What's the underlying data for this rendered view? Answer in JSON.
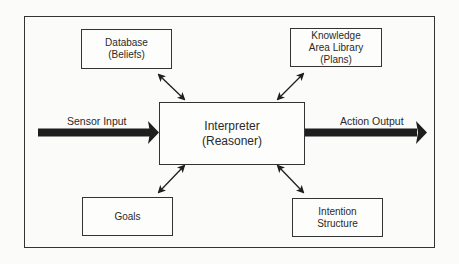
{
  "diagram": {
    "nodes": {
      "database": {
        "lines": [
          "Database",
          "(Beliefs)"
        ]
      },
      "knowledge": {
        "lines": [
          "Knowledge",
          "Area Library",
          "(Plans)"
        ]
      },
      "interpreter": {
        "lines": [
          "Interpreter",
          "(Reasoner)"
        ]
      },
      "goals": {
        "lines": [
          "Goals"
        ]
      },
      "intention": {
        "lines": [
          "Intention",
          "Structure"
        ]
      }
    },
    "edges": {
      "sensor_input": "Sensor Input",
      "action_output": "Action Output"
    },
    "connections": [
      {
        "from": "database",
        "to": "interpreter",
        "type": "bidirectional"
      },
      {
        "from": "knowledge",
        "to": "interpreter",
        "type": "bidirectional"
      },
      {
        "from": "goals",
        "to": "interpreter",
        "type": "bidirectional"
      },
      {
        "from": "intention",
        "to": "interpreter",
        "type": "bidirectional"
      }
    ],
    "colors": {
      "stroke": "#333333",
      "arrow_fill": "#1e1e1e",
      "background": "#fbfbfa"
    }
  }
}
